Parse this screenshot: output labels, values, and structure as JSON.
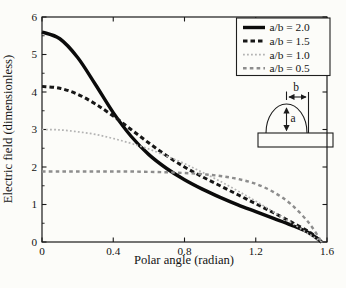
{
  "figure": {
    "width": 346,
    "height": 288,
    "background": "#fcfcf9",
    "axis_color": "#1a1a1a"
  },
  "chart_data": {
    "type": "line",
    "title": "",
    "xlabel": "Polar angle (radian)",
    "ylabel": "Electric field (dimensionless)",
    "xlim": [
      0,
      1.6
    ],
    "ylim": [
      0,
      6
    ],
    "grid": false,
    "legend_position": "top-right",
    "xticks": {
      "values": [
        0,
        0.4,
        0.8,
        1.2,
        1.6
      ],
      "labels": [
        "0",
        "0.4",
        "0.8",
        "1.2",
        "1.6"
      ]
    },
    "yticks": {
      "values": [
        0,
        1,
        2,
        3,
        4,
        5,
        6
      ],
      "labels": [
        "0",
        "1",
        "2",
        "3",
        "4",
        "5",
        "6"
      ]
    },
    "y_minor_step": 0.5,
    "x": [
      0,
      0.1,
      0.2,
      0.3,
      0.4,
      0.5,
      0.6,
      0.7,
      0.8,
      0.9,
      1.0,
      1.1,
      1.2,
      1.3,
      1.4,
      1.5,
      1.57
    ],
    "series": [
      {
        "name": "ab-2.0",
        "label": "a/b = 2.0",
        "color": "#0b0b0b",
        "dash": "solid",
        "values": [
          5.6,
          5.42,
          4.92,
          4.2,
          3.45,
          2.82,
          2.33,
          1.96,
          1.66,
          1.41,
          1.19,
          0.99,
          0.81,
          0.63,
          0.45,
          0.24,
          0
        ]
      },
      {
        "name": "ab-1.5",
        "label": "a/b = 1.5",
        "color": "#171717",
        "dash": "dashed",
        "values": [
          4.15,
          4.1,
          3.94,
          3.68,
          3.36,
          3.0,
          2.64,
          2.3,
          2.0,
          1.74,
          1.5,
          1.26,
          1.02,
          0.78,
          0.53,
          0.27,
          0
        ]
      },
      {
        "name": "ab-1.0",
        "label": "a/b = 1.0",
        "color": "#b3b3b3",
        "dash": "dotted",
        "values": [
          3.0,
          2.99,
          2.94,
          2.87,
          2.76,
          2.63,
          2.48,
          2.29,
          2.09,
          1.86,
          1.62,
          1.36,
          1.09,
          0.8,
          0.51,
          0.21,
          0
        ]
      },
      {
        "name": "ab-0.5",
        "label": "a/b = 0.5",
        "color": "#8d8d8d",
        "dash": "dashed-short",
        "values": [
          1.88,
          1.88,
          1.88,
          1.88,
          1.88,
          1.88,
          1.87,
          1.86,
          1.84,
          1.81,
          1.76,
          1.68,
          1.55,
          1.33,
          1.0,
          0.5,
          0
        ]
      }
    ]
  },
  "inset": {
    "label_a": "a",
    "label_b": "b",
    "slab_color": "#bdbdbd"
  }
}
